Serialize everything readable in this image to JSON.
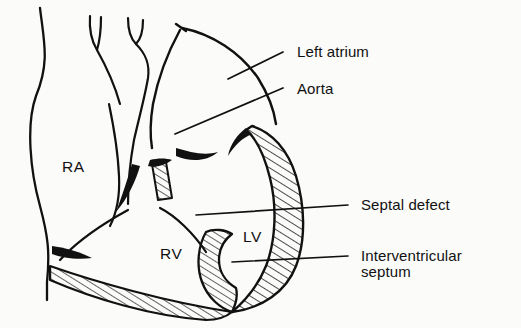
{
  "figure": {
    "background_color": "#fbfbfa",
    "ink_color": "#111111"
  },
  "chamber_labels": [
    {
      "id": "ra",
      "text": "RA",
      "meaning": "right atrium",
      "x": 62,
      "y": 172
    },
    {
      "id": "rv",
      "text": "RV",
      "meaning": "right ventricle",
      "x": 160,
      "y": 259
    },
    {
      "id": "lv",
      "text": "LV",
      "meaning": "left ventricle",
      "x": 243,
      "y": 242
    }
  ],
  "callout_labels": [
    {
      "id": "left-atrium",
      "text": "Left atrium",
      "x": 297,
      "y": 57,
      "leader": {
        "x1": 283,
        "y1": 52,
        "x2": 228,
        "y2": 79
      }
    },
    {
      "id": "aorta",
      "text": "Aorta",
      "x": 297,
      "y": 94,
      "leader": {
        "x1": 283,
        "y1": 88,
        "x2": 175,
        "y2": 134
      }
    },
    {
      "id": "septal-defect",
      "text": "Septal defect",
      "x": 361,
      "y": 210,
      "leader": {
        "x1": 348,
        "y1": 205,
        "x2": 196,
        "y2": 215
      }
    },
    {
      "id": "interventricular-septum",
      "text": "Interventricular",
      "text_line2": "septum",
      "x": 361,
      "y": 261,
      "leader": {
        "x1": 348,
        "y1": 256,
        "x2": 232,
        "y2": 262
      }
    }
  ],
  "structures": [
    {
      "id": "right-atrium-wall",
      "name": "right atrium outline"
    },
    {
      "id": "great-vessel-left",
      "name": "superior vena cava branch"
    },
    {
      "id": "great-vessel-right",
      "name": "pulmonary artery branch"
    },
    {
      "id": "left-atrium-dome",
      "name": "left atrium dome outline"
    },
    {
      "id": "aortic-root",
      "name": "aortic root outline"
    },
    {
      "id": "lv-free-wall",
      "name": "left ventricular free wall (hatched myocardium)"
    },
    {
      "id": "rv-free-wall",
      "name": "right ventricular free wall (hatched myocardium)"
    },
    {
      "id": "interventricular-septum-body",
      "name": "interventricular septum (hatched)"
    },
    {
      "id": "septal-stub",
      "name": "septal remnant above defect (hatched)"
    },
    {
      "id": "defect-gap",
      "name": "septal defect opening"
    },
    {
      "id": "valve-leaflets",
      "name": "valve leaflets (solid black)"
    }
  ]
}
